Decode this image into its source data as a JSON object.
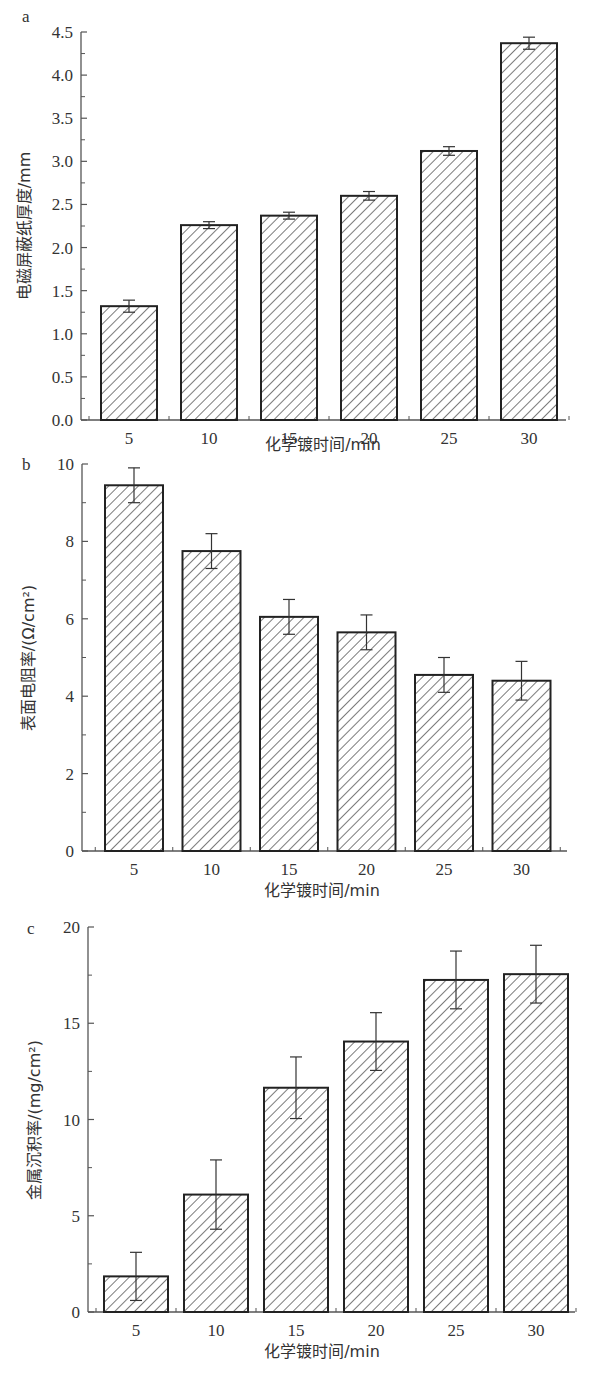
{
  "chart_data": [
    {
      "panel": "a",
      "type": "bar",
      "title": "",
      "xlabel": "化学镀时间/min",
      "ylabel": "电磁屏蔽纸厚度/mm",
      "categories": [
        "5",
        "10",
        "15",
        "20",
        "25",
        "30"
      ],
      "values": [
        1.32,
        2.26,
        2.37,
        2.6,
        3.12,
        4.37
      ],
      "errors": [
        0.07,
        0.04,
        0.04,
        0.05,
        0.05,
        0.07
      ],
      "yticks": [
        "0.0",
        "0.5",
        "1.0",
        "1.5",
        "2.0",
        "2.5",
        "3.0",
        "3.5",
        "4.0",
        "4.5"
      ],
      "ylim": [
        0,
        4.5
      ],
      "grid": false,
      "legend": null,
      "bar_fill": "diagonal hatch"
    },
    {
      "panel": "b",
      "type": "bar",
      "title": "",
      "xlabel": "化学镀时间/min",
      "ylabel": "表面电阻率/(Ω/cm²)",
      "categories": [
        "5",
        "10",
        "15",
        "20",
        "25",
        "30"
      ],
      "values": [
        9.45,
        7.75,
        6.05,
        5.65,
        4.55,
        4.4
      ],
      "errors": [
        0.45,
        0.45,
        0.45,
        0.45,
        0.45,
        0.5
      ],
      "yticks": [
        "0",
        "2",
        "4",
        "6",
        "8",
        "10"
      ],
      "ylim": [
        0,
        10
      ],
      "grid": false,
      "legend": null,
      "bar_fill": "diagonal hatch"
    },
    {
      "panel": "c",
      "type": "bar",
      "title": "",
      "xlabel": "化学镀时间/min",
      "ylabel": "金属沉积率/(mg/cm²)",
      "categories": [
        "5",
        "10",
        "15",
        "20",
        "25",
        "30"
      ],
      "values": [
        1.85,
        6.1,
        11.65,
        14.05,
        17.25,
        17.55
      ],
      "errors": [
        1.25,
        1.8,
        1.6,
        1.5,
        1.5,
        1.5
      ],
      "yticks": [
        "0",
        "5",
        "10",
        "15",
        "20"
      ],
      "ylim": [
        0,
        20
      ],
      "grid": false,
      "legend": null,
      "bar_fill": "diagonal hatch"
    }
  ],
  "panels": {
    "a": {
      "label": "a",
      "xlabel": "化学镀时间/min",
      "ylabel": "电磁屏蔽纸厚度/mm"
    },
    "b": {
      "label": "b",
      "xlabel": "化学镀时间/min",
      "ylabel": "表面电阻率/(Ω/cm²)"
    },
    "c": {
      "label": "c",
      "xlabel": "化学镀时间/min",
      "ylabel": "金属沉积率/(mg/cm²)"
    }
  },
  "colors": {
    "stroke": "#222222",
    "background": "#ffffff",
    "axis": "#555555"
  }
}
